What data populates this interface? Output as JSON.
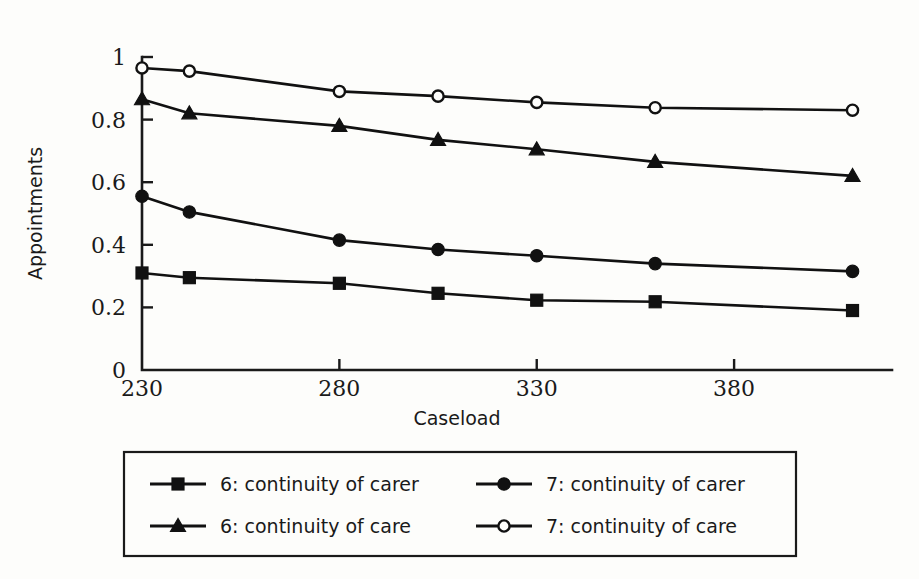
{
  "chart_data": {
    "type": "line",
    "title": "",
    "xlabel": "Caseload",
    "ylabel": "Appointments",
    "x": [
      230,
      242,
      280,
      305,
      330,
      360,
      410
    ],
    "xlim": [
      230,
      420
    ],
    "ylim": [
      0,
      1
    ],
    "xticks": [
      230,
      280,
      330,
      380
    ],
    "xticklabels": [
      "230",
      "280",
      "330",
      "380"
    ],
    "yticks": [
      0,
      0.2,
      0.4,
      0.6,
      0.8,
      1
    ],
    "yticklabels": [
      "0",
      "0.2",
      "0.4",
      "0.6",
      "0.8",
      "1"
    ],
    "grid": false,
    "legend_position": "below",
    "series": [
      {
        "name": "6: continuity of carer",
        "marker": "filled-square",
        "values": [
          0.31,
          0.295,
          0.277,
          0.245,
          0.223,
          0.218,
          0.19
        ]
      },
      {
        "name": "6: continuity of care",
        "marker": "filled-triangle",
        "values": [
          0.865,
          0.82,
          0.78,
          0.735,
          0.705,
          0.665,
          0.62
        ]
      },
      {
        "name": "7: continuity of carer",
        "marker": "filled-circle",
        "values": [
          0.555,
          0.505,
          0.415,
          0.385,
          0.365,
          0.34,
          0.315
        ]
      },
      {
        "name": "7: continuity of care",
        "marker": "open-circle",
        "values": [
          0.965,
          0.955,
          0.89,
          0.875,
          0.855,
          0.838,
          0.83
        ]
      }
    ]
  },
  "legend": {
    "entries": [
      {
        "label": "6: continuity of carer",
        "marker": "filled-square",
        "col": 0,
        "row": 0
      },
      {
        "label": "7: continuity of carer",
        "marker": "filled-circle",
        "col": 1,
        "row": 0
      },
      {
        "label": "6: continuity of care",
        "marker": "filled-triangle",
        "col": 0,
        "row": 1
      },
      {
        "label": "7: continuity of care",
        "marker": "open-circle",
        "col": 1,
        "row": 1
      }
    ]
  },
  "colors": {
    "ink": "#111111",
    "background": "#fdfdfb"
  }
}
